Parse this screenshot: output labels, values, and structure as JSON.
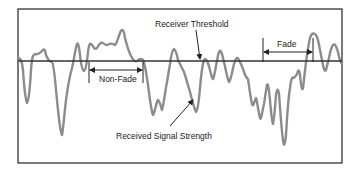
{
  "diagram": {
    "labels": {
      "threshold": "Receiver Threshold",
      "non_fade": "Non-Fade",
      "fade": "Fade",
      "signal": "Received Signal Strength"
    },
    "colors": {
      "frame": "#333333",
      "threshold_line": "#333333",
      "signal": "#8c8c8c",
      "text": "#222222"
    }
  }
}
